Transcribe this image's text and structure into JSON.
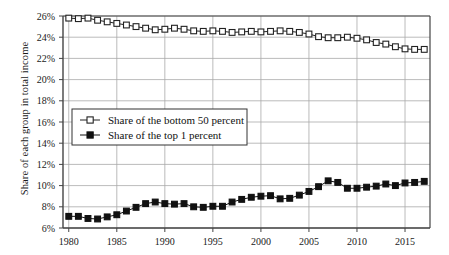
{
  "chart_data": {
    "type": "line",
    "title": "",
    "xlabel": "",
    "ylabel": "Share of each group in total income",
    "xlim": [
      1979.4,
      2017.6
    ],
    "ylim": [
      6,
      26
    ],
    "yticks": [
      "6%",
      "8%",
      "10%",
      "12%",
      "14%",
      "16%",
      "18%",
      "20%",
      "22%",
      "24%",
      "26%"
    ],
    "ytick_values": [
      6,
      8,
      10,
      12,
      14,
      16,
      18,
      20,
      22,
      24,
      26
    ],
    "xticks": [
      "1980",
      "1985",
      "1990",
      "1995",
      "2000",
      "2005",
      "2010",
      "2015"
    ],
    "xtick_values": [
      1980,
      1985,
      1990,
      1995,
      2000,
      2005,
      2010,
      2015
    ],
    "grid": true,
    "legend_position": "center-left",
    "x": [
      1980,
      1981,
      1982,
      1983,
      1984,
      1985,
      1986,
      1987,
      1988,
      1989,
      1990,
      1991,
      1992,
      1993,
      1994,
      1995,
      1996,
      1997,
      1998,
      1999,
      2000,
      2001,
      2002,
      2003,
      2004,
      2005,
      2006,
      2007,
      2008,
      2009,
      2010,
      2011,
      2012,
      2013,
      2014,
      2015,
      2016,
      2017
    ],
    "series": [
      {
        "name": "Share of the bottom 50 percent",
        "marker": "open-square",
        "color": "#222222",
        "values": [
          25.8,
          25.75,
          25.8,
          25.6,
          25.45,
          25.3,
          25.15,
          25.0,
          24.85,
          24.7,
          24.75,
          24.85,
          24.75,
          24.6,
          24.55,
          24.6,
          24.55,
          24.45,
          24.5,
          24.55,
          24.5,
          24.55,
          24.6,
          24.55,
          24.45,
          24.3,
          24.05,
          23.95,
          23.95,
          24.0,
          23.9,
          23.75,
          23.5,
          23.35,
          23.1,
          22.9,
          22.85,
          22.85
        ]
      },
      {
        "name": "Share of the top 1 percent",
        "marker": "filled-square",
        "color": "#111111",
        "values": [
          7.1,
          7.1,
          6.9,
          6.85,
          7.05,
          7.25,
          7.6,
          7.95,
          8.3,
          8.45,
          8.3,
          8.25,
          8.3,
          8.0,
          7.95,
          8.05,
          8.05,
          8.45,
          8.7,
          8.9,
          9.0,
          9.05,
          8.75,
          8.8,
          9.1,
          9.45,
          9.9,
          10.45,
          10.3,
          9.75,
          9.75,
          9.85,
          9.95,
          10.15,
          10.0,
          10.25,
          10.3,
          10.4
        ]
      }
    ]
  }
}
